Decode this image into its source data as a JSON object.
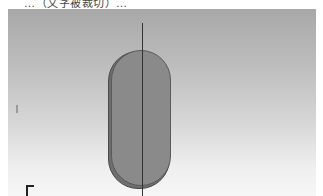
{
  "top_strip": {
    "text": "…（文字被裁切）…"
  },
  "viewport": {
    "background_top": "#a8a8a8",
    "background_bottom": "#f6f6f6",
    "shape": {
      "type": "obround-extrusion",
      "fill": "#8a8a8a",
      "edge": "#5a5a5a"
    },
    "axis_line_color": "#333333",
    "corner_indicator": "axis-triad-icon"
  }
}
